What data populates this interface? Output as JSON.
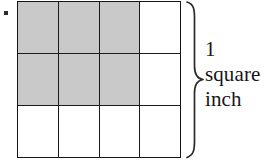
{
  "figure": {
    "caption_lines": [
      "1",
      "square",
      "inch"
    ],
    "bullet": "•",
    "ink_color": "#1b1b1b",
    "shade_color": "#c9c9c9",
    "background_color": "#ffffff"
  },
  "grid": {
    "columns": 4,
    "rows": 3,
    "shaded_count": 6,
    "cells": [
      {
        "row": 1,
        "col": 1,
        "shaded": true
      },
      {
        "row": 1,
        "col": 2,
        "shaded": true
      },
      {
        "row": 1,
        "col": 3,
        "shaded": true
      },
      {
        "row": 1,
        "col": 4,
        "shaded": false
      },
      {
        "row": 2,
        "col": 1,
        "shaded": true
      },
      {
        "row": 2,
        "col": 2,
        "shaded": true
      },
      {
        "row": 2,
        "col": 3,
        "shaded": true
      },
      {
        "row": 2,
        "col": 4,
        "shaded": false
      },
      {
        "row": 3,
        "col": 1,
        "shaded": false
      },
      {
        "row": 3,
        "col": 2,
        "shaded": false
      },
      {
        "row": 3,
        "col": 3,
        "shaded": false
      },
      {
        "row": 3,
        "col": 4,
        "shaded": false
      }
    ]
  },
  "annotation": {
    "brace_label_line1": "1",
    "brace_label_line2": "square",
    "brace_label_line3": "inch"
  }
}
